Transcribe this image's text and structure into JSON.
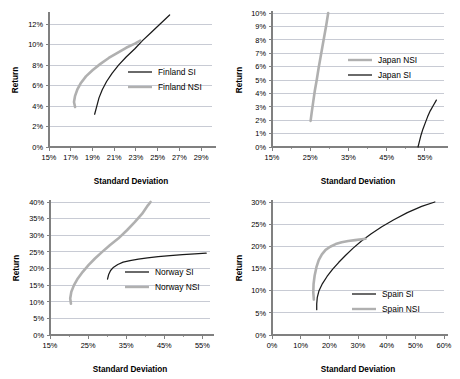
{
  "figure": {
    "panel_count": 4,
    "colors": {
      "si_line": "#1a1a1a",
      "nsi_line": "#b0b0b0",
      "grid": "#9aa0b0",
      "axis": "#808080",
      "background": "#ffffff"
    }
  },
  "panels": [
    {
      "id": "finland",
      "chart_data": {
        "type": "line",
        "title": "",
        "xlabel": "Standard Deviation",
        "ylabel": "Return",
        "xlim": [
          15,
          30
        ],
        "ylim": [
          0,
          13
        ],
        "xticks": [
          "15%",
          "17%",
          "19%",
          "21%",
          "23%",
          "25%",
          "27%",
          "29%"
        ],
        "xtick_values": [
          15,
          17,
          19,
          21,
          23,
          25,
          27,
          29
        ],
        "yticks": [
          "0%",
          "2%",
          "4%",
          "6%",
          "8%",
          "10%",
          "12%"
        ],
        "ytick_values": [
          0,
          2,
          4,
          6,
          8,
          10,
          12
        ],
        "grid": true,
        "legend_position": "center-right",
        "series": [
          {
            "name": "Finland SI",
            "color": "#1a1a1a",
            "points": [
              [
                19.2,
                3.2
              ],
              [
                19.4,
                4.0
              ],
              [
                19.6,
                4.8
              ],
              [
                19.9,
                5.6
              ],
              [
                20.3,
                6.4
              ],
              [
                20.8,
                7.2
              ],
              [
                21.4,
                8.0
              ],
              [
                22.1,
                8.8
              ],
              [
                22.9,
                9.6
              ],
              [
                23.6,
                10.4
              ],
              [
                24.4,
                11.2
              ],
              [
                25.2,
                12.0
              ],
              [
                26.1,
                12.9
              ]
            ]
          },
          {
            "name": "Finland NSI",
            "color": "#b0b0b0",
            "points": [
              [
                17.4,
                3.9
              ],
              [
                17.3,
                4.4
              ],
              [
                17.4,
                5.0
              ],
              [
                17.6,
                5.6
              ],
              [
                17.9,
                6.2
              ],
              [
                18.4,
                6.9
              ],
              [
                19.0,
                7.5
              ],
              [
                19.7,
                8.1
              ],
              [
                20.5,
                8.7
              ],
              [
                21.3,
                9.2
              ],
              [
                22.1,
                9.7
              ],
              [
                22.9,
                10.1
              ],
              [
                23.4,
                10.4
              ]
            ]
          }
        ]
      }
    },
    {
      "id": "japan",
      "chart_data": {
        "type": "line",
        "title": "",
        "xlabel": "Standard Deviation",
        "ylabel": "Return",
        "xlim": [
          15,
          60
        ],
        "ylim": [
          0,
          10
        ],
        "xticks": [
          "15%",
          "25%",
          "35%",
          "45%",
          "55%"
        ],
        "xtick_values": [
          15,
          25,
          35,
          45,
          55
        ],
        "yticks": [
          "0%",
          "1%",
          "2%",
          "3%",
          "4%",
          "5%",
          "6%",
          "7%",
          "8%",
          "9%",
          "10%"
        ],
        "ytick_values": [
          0,
          1,
          2,
          3,
          4,
          5,
          6,
          7,
          8,
          9,
          10
        ],
        "grid": true,
        "legend_position": "center",
        "series": [
          {
            "name": "Japan NSI",
            "color": "#b0b0b0",
            "points": [
              [
                25.1,
                1.95
              ],
              [
                25.4,
                2.6
              ],
              [
                25.8,
                3.4
              ],
              [
                26.2,
                4.2
              ],
              [
                26.7,
                5.0
              ],
              [
                27.2,
                5.9
              ],
              [
                27.7,
                6.7
              ],
              [
                28.2,
                7.5
              ],
              [
                28.7,
                8.3
              ],
              [
                29.2,
                9.1
              ],
              [
                29.7,
                10.0
              ]
            ]
          },
          {
            "name": "Japan SI",
            "color": "#1a1a1a",
            "points": [
              [
                53.2,
                0.0
              ],
              [
                53.6,
                0.45
              ],
              [
                54.0,
                0.9
              ],
              [
                54.5,
                1.35
              ],
              [
                55.1,
                1.8
              ],
              [
                55.7,
                2.25
              ],
              [
                56.4,
                2.7
              ],
              [
                57.2,
                3.1
              ],
              [
                58.0,
                3.5
              ]
            ]
          }
        ]
      }
    },
    {
      "id": "norway",
      "chart_data": {
        "type": "line",
        "title": "",
        "xlabel": "Standard Deviation",
        "ylabel": "Return",
        "xlim": [
          15,
          57
        ],
        "ylim": [
          0,
          40
        ],
        "xticks": [
          "15%",
          "25%",
          "35%",
          "45%",
          "55%"
        ],
        "xtick_values": [
          15,
          25,
          35,
          45,
          55
        ],
        "yticks": [
          "0%",
          "5%",
          "10%",
          "15%",
          "20%",
          "25%",
          "30%",
          "35%",
          "40%"
        ],
        "ytick_values": [
          0,
          5,
          10,
          15,
          20,
          25,
          30,
          35,
          40
        ],
        "grid": true,
        "legend_position": "center-right",
        "series": [
          {
            "name": "Norway SI",
            "color": "#1a1a1a",
            "points": [
              [
                30.1,
                16.8
              ],
              [
                30.4,
                18.2
              ],
              [
                30.9,
                19.4
              ],
              [
                31.7,
                20.4
              ],
              [
                32.8,
                21.2
              ],
              [
                34.2,
                21.9
              ],
              [
                36.0,
                22.4
              ],
              [
                38.2,
                22.8
              ],
              [
                40.6,
                23.2
              ],
              [
                43.4,
                23.6
              ],
              [
                46.5,
                23.9
              ],
              [
                49.8,
                24.2
              ],
              [
                53.0,
                24.4
              ],
              [
                56.0,
                24.6
              ]
            ]
          },
          {
            "name": "Norway NSI",
            "color": "#b0b0b0",
            "points": [
              [
                20.5,
                9.4
              ],
              [
                20.3,
                11.0
              ],
              [
                20.6,
                13.0
              ],
              [
                21.3,
                15.0
              ],
              [
                22.3,
                17.0
              ],
              [
                23.6,
                19.0
              ],
              [
                25.1,
                21.0
              ],
              [
                26.8,
                23.0
              ],
              [
                28.7,
                25.0
              ],
              [
                30.7,
                27.0
              ],
              [
                32.9,
                29.0
              ],
              [
                35.2,
                31.5
              ],
              [
                37.3,
                34.0
              ],
              [
                39.2,
                36.5
              ],
              [
                40.7,
                39.0
              ],
              [
                41.4,
                40.0
              ]
            ]
          }
        ]
      }
    },
    {
      "id": "spain",
      "chart_data": {
        "type": "line",
        "title": "",
        "xlabel": "Standard Deviation",
        "ylabel": "Return",
        "xlim": [
          0,
          60
        ],
        "ylim": [
          0,
          30
        ],
        "xticks": [
          "0%",
          "10%",
          "20%",
          "30%",
          "40%",
          "50%",
          "60%"
        ],
        "xtick_values": [
          0,
          10,
          20,
          30,
          40,
          50,
          60
        ],
        "yticks": [
          "0%",
          "5%",
          "10%",
          "15%",
          "20%",
          "25%",
          "30%"
        ],
        "ytick_values": [
          0,
          5,
          10,
          15,
          20,
          25,
          30
        ],
        "grid": true,
        "legend_position": "lower-right",
        "series": [
          {
            "name": "Spain SI",
            "color": "#1a1a1a",
            "points": [
              [
                15.6,
                5.7
              ],
              [
                15.6,
                7.0
              ],
              [
                15.8,
                8.5
              ],
              [
                16.4,
                10.0
              ],
              [
                17.6,
                11.6
              ],
              [
                19.2,
                13.2
              ],
              [
                21.1,
                14.8
              ],
              [
                23.3,
                16.4
              ],
              [
                25.7,
                18.0
              ],
              [
                28.3,
                19.6
              ],
              [
                31.2,
                21.2
              ],
              [
                34.5,
                22.8
              ],
              [
                38.3,
                24.4
              ],
              [
                42.5,
                26.0
              ],
              [
                47.2,
                27.6
              ],
              [
                52.2,
                29.0
              ],
              [
                56.8,
                30.0
              ]
            ]
          },
          {
            "name": "Spain NSI",
            "color": "#b0b0b0",
            "points": [
              [
                14.6,
                8.0
              ],
              [
                14.4,
                9.6
              ],
              [
                14.5,
                11.5
              ],
              [
                14.9,
                13.5
              ],
              [
                15.5,
                15.3
              ],
              [
                16.3,
                16.9
              ],
              [
                17.4,
                18.2
              ],
              [
                18.7,
                19.2
              ],
              [
                20.3,
                19.9
              ],
              [
                22.2,
                20.5
              ],
              [
                24.3,
                20.9
              ],
              [
                26.6,
                21.2
              ],
              [
                29.0,
                21.4
              ],
              [
                31.2,
                21.6
              ],
              [
                32.6,
                21.7
              ]
            ]
          }
        ]
      }
    }
  ]
}
